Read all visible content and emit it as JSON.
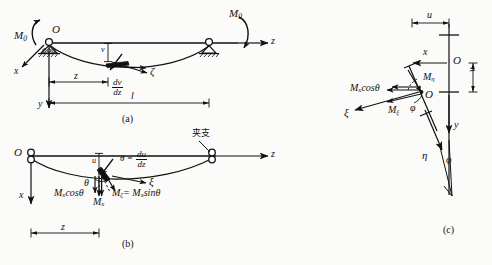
{
  "figure": {
    "caption_a": "(a)",
    "caption_b": "(b)",
    "caption_c": "(c)",
    "ink_color": "#111111",
    "background_color": "#fbfbf9"
  },
  "panel_a": {
    "name": "simply-supported-beam-lateral-deflection",
    "origin_label": "O",
    "moment_left": "M",
    "moment_left_sub": "0",
    "moment_right": "M",
    "moment_right_sub": "0",
    "axis_z": "z",
    "axis_x": "x",
    "axis_y": "y",
    "deflection_label": "v",
    "slope_numerator": "dv",
    "slope_denominator": "dz",
    "twist_axis": "ζ",
    "dim_z": "z",
    "dim_l": "l"
  },
  "panel_b": {
    "name": "beam-cross-section-moment-components",
    "origin_label": "O",
    "axis_z": "z",
    "axis_x": "x",
    "support_note": "夹支",
    "deflection_label": "u",
    "angle_theta": "θ",
    "slope_equals": "θ =",
    "slope_numerator": "du",
    "slope_denominator": "dz",
    "axis_xi": "ξ",
    "moment_mx": "M",
    "moment_mx_sub": "x",
    "moment_mx_cos": "M",
    "moment_mx_cos_sub": "x",
    "moment_mx_cos_tail": "cosθ",
    "moment_mzeta": "M",
    "moment_mzeta_sub": "ζ",
    "moment_mzeta_rhs_head": "= M",
    "moment_mzeta_rhs_sub": "x",
    "moment_mzeta_rhs_tail": "sinθ",
    "dim_z": "z"
  },
  "panel_c": {
    "name": "rotated-cross-section-moment-resolution",
    "origin_label_top": "O",
    "origin_label_mid": "O",
    "dim_u": "u",
    "dim_v": "v",
    "axis_x": "x",
    "axis_y": "y",
    "axis_xi": "ξ",
    "axis_eta": "η",
    "angle_phi_upper": "φ",
    "angle_phi_lower": "φ",
    "moment_meta": "M",
    "moment_meta_sub": "η",
    "moment_mxi": "M",
    "moment_mxi_sub": "ξ",
    "moment_mx_cos": "M",
    "moment_mx_cos_sub": "x",
    "moment_mx_cos_tail": "cosθ"
  }
}
